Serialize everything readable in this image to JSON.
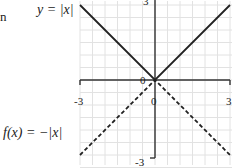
{
  "chart_data": {
    "type": "line",
    "title": "",
    "xlabel": "",
    "ylabel": "",
    "xlim": [
      -3,
      3
    ],
    "ylim": [
      -3,
      3
    ],
    "grid": true,
    "grid_step": 0.5,
    "x_ticks": [
      "-3",
      "0",
      "3"
    ],
    "y_ticks": [
      "3",
      "0",
      "-3"
    ],
    "origin_label": "0",
    "series": [
      {
        "name": "y = |x|",
        "style": "solid",
        "color": "#222222",
        "x": [
          -3,
          0,
          3
        ],
        "y": [
          3,
          0,
          3
        ]
      },
      {
        "name": "f(x) = −|x|",
        "style": "dashed",
        "color": "#222222",
        "x": [
          -3,
          0,
          3
        ],
        "y": [
          -3,
          0,
          -3
        ]
      }
    ],
    "annotations": [
      {
        "text": "y = |x|",
        "position": "upper-left"
      },
      {
        "text": "f(x) = −|x|",
        "position": "lower-left"
      }
    ]
  },
  "labels": {
    "fragment_left": "n",
    "eq_top": "y = |x|",
    "eq_bottom_f": "f",
    "eq_bottom_rest": "(x) = −|x|",
    "tick_x_neg": "-3",
    "tick_x_zero": "0",
    "tick_x_pos": "3",
    "tick_y_pos": "3",
    "tick_y_neg": "-3",
    "origin": "0"
  },
  "colors": {
    "grid": "#e2e2e2",
    "axis": "#333333",
    "line": "#222222"
  }
}
